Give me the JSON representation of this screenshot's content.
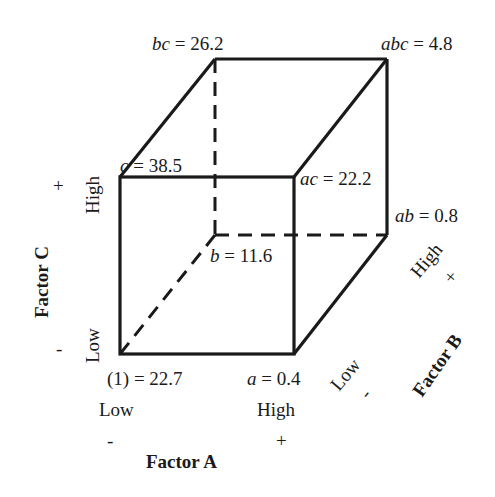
{
  "diagram": {
    "type": "2^3 factorial design cube",
    "vertices": [
      {
        "id": "one",
        "label": "(1)",
        "value": "22.7",
        "text": "(1) = 22.7"
      },
      {
        "id": "a",
        "label": "a",
        "value": "0.4",
        "text": "= 0.4"
      },
      {
        "id": "b",
        "label": "b",
        "value": "11.6",
        "text": "= 11.6"
      },
      {
        "id": "ab",
        "label": "ab",
        "value": "0.8",
        "text": "= 0.8"
      },
      {
        "id": "c",
        "label": "c",
        "value": "38.5",
        "text": "= 38.5"
      },
      {
        "id": "ac",
        "label": "ac",
        "value": "22.2",
        "text": "= 22.2"
      },
      {
        "id": "bc",
        "label": "bc",
        "value": "26.2",
        "text": "= 26.2"
      },
      {
        "id": "abc",
        "label": "abc",
        "value": "4.8",
        "text": "= 4.8"
      }
    ],
    "factors": {
      "A": {
        "name": "Factor A",
        "low": "Low",
        "high": "High",
        "low_sign": "-",
        "high_sign": "+"
      },
      "B": {
        "name": "Factor B",
        "low": "Low",
        "high": "High",
        "low_sign": "-",
        "high_sign": "+"
      },
      "C": {
        "name": "Factor C",
        "low": "Low",
        "high": "High",
        "low_sign": "-",
        "high_sign": "+"
      }
    },
    "colors": {
      "line": "#1a1a1a",
      "background": "#ffffff"
    }
  }
}
